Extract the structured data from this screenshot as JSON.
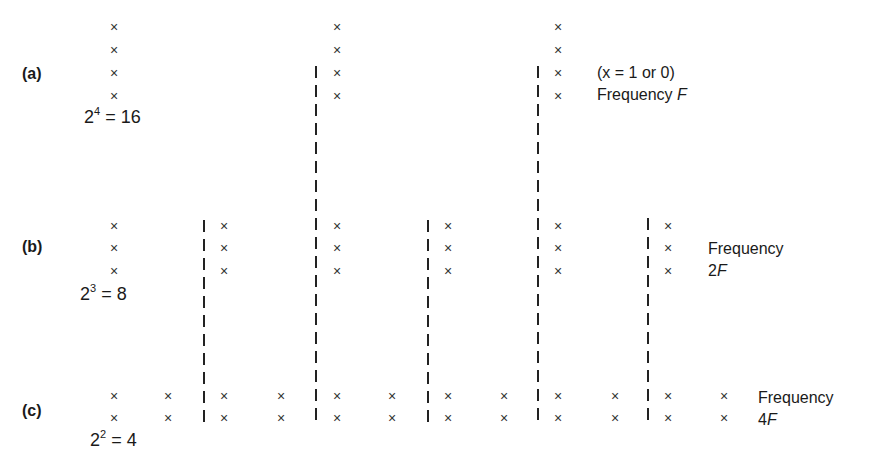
{
  "rows": [
    {
      "label": "(a)",
      "equation_base": "2",
      "equation_exp": "4",
      "equation_rest": " = 16",
      "annotation_lines": [
        "(x = 1 or 0)",
        "Frequency "
      ],
      "annotation_italic": "F",
      "mark_symbol": "×",
      "columns_count": 3,
      "marks_per_column": 4
    },
    {
      "label": "(b)",
      "equation_base": "2",
      "equation_exp": "3",
      "equation_rest": " = 8",
      "annotation_lines": [
        "Frequency",
        "2"
      ],
      "annotation_italic": "F",
      "mark_symbol": "×",
      "columns_count": 6,
      "marks_per_column": 3
    },
    {
      "label": "(c)",
      "equation_base": "2",
      "equation_exp": "2",
      "equation_rest": " = 4",
      "annotation_lines": [
        "Frequency",
        "4"
      ],
      "annotation_italic": "F",
      "mark_symbol": "×",
      "columns_count": 12,
      "marks_per_column": 2
    }
  ],
  "dividers_count": 5
}
